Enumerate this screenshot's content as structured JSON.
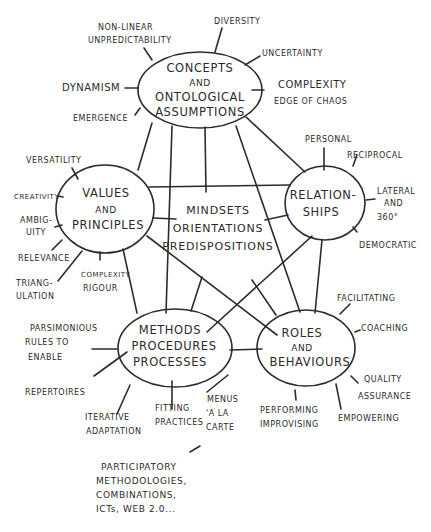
{
  "diagram": {
    "stroke_color": "#2b2b2b",
    "background": "#ffffff",
    "center": {
      "lines": [
        "MINDSETS",
        "ORIENTATIONS",
        "PREDISPOSITIONS"
      ]
    },
    "nodes": {
      "concepts": {
        "lines": [
          "CONCEPTS",
          "AND",
          "ONTOLOGICAL",
          "ASSUMPTIONS"
        ],
        "leaves": [
          [
            "NON-LINEAR",
            "UNPREDICTABILITY"
          ],
          [
            "DIVERSITY"
          ],
          [
            "UNCERTAINTY"
          ],
          [
            "COMPLEXITY",
            "EDGE OF CHAOS"
          ],
          [
            "DYNAMISM"
          ],
          [
            "EMERGENCE"
          ]
        ]
      },
      "values": {
        "lines": [
          "VALUES",
          "AND",
          "PRINCIPLES"
        ],
        "leaves": [
          [
            "VERSATILITY"
          ],
          [
            "CREATIVITY"
          ],
          [
            "AMBIG-",
            "UITY"
          ],
          [
            "RELEVANCE"
          ],
          [
            "TRIANG-",
            "ULATION"
          ],
          [
            "COMPLEXITY",
            "RIGOUR"
          ]
        ]
      },
      "relationships": {
        "lines": [
          "RELATION-",
          "SHIPS"
        ],
        "leaves": [
          [
            "PERSONAL"
          ],
          [
            "RECIPROCAL"
          ],
          [
            "LATERAL",
            "AND",
            "360°"
          ],
          [
            "DEMOCRATIC"
          ]
        ]
      },
      "methods": {
        "lines": [
          "METHODS",
          "PROCEDURES",
          "PROCESSES"
        ],
        "leaves": [
          [
            "PARSIMONIOUS",
            "RULES TO",
            "ENABLE"
          ],
          [
            "REPERTOIRES"
          ],
          [
            "ITERATIVE",
            "ADAPTATION"
          ],
          [
            "FITTING",
            "PRACTICES"
          ],
          [
            "MENUS",
            "'A LA",
            "CARTE"
          ]
        ]
      },
      "roles": {
        "lines": [
          "ROLES",
          "AND",
          "BEHAVIOURS"
        ],
        "leaves": [
          [
            "FACILITATING"
          ],
          [
            "COACHING"
          ],
          [
            "QUALITY",
            "ASSURANCE"
          ],
          [
            "EMPOWERING"
          ],
          [
            "PERFORMING",
            "IMPROVISING"
          ]
        ]
      }
    },
    "note": {
      "lines": [
        "PARTICIPATORY",
        "METHODOLOGIES,",
        "COMBINATIONS,",
        "ICTs, WEB 2.0..."
      ]
    }
  }
}
